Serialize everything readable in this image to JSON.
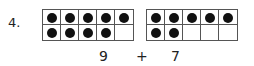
{
  "problem": {
    "number": "4.",
    "left_frame": {
      "filled": [
        1,
        1,
        1,
        1,
        1,
        1,
        1,
        1,
        1,
        0
      ],
      "count": 9
    },
    "right_frame": {
      "filled": [
        1,
        1,
        1,
        1,
        1,
        1,
        1,
        0,
        0,
        0
      ],
      "count": 7
    },
    "expression": {
      "left": "9",
      "operator": "+",
      "right": "7"
    }
  }
}
